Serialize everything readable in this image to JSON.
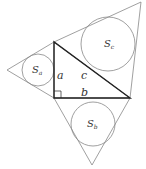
{
  "diagram": {
    "colors": {
      "thin_stroke": "#888888",
      "thick_stroke": "#222222",
      "text": "#333333"
    },
    "labels": {
      "side_a": "a",
      "side_b": "b",
      "side_c": "c",
      "circle_a": "S",
      "circle_a_sub": "a",
      "circle_b": "S",
      "circle_b_sub": "b",
      "circle_c": "S",
      "circle_c_sub": "c"
    }
  }
}
